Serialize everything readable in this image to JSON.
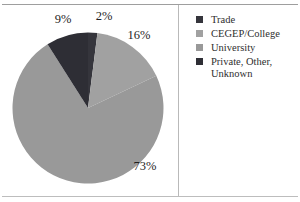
{
  "chart_data": {
    "type": "pie",
    "title": "",
    "values_unit": "%",
    "direction": "clockwise",
    "start_angle_deg": 0,
    "legend_position": "right",
    "slices": [
      {
        "id": "trade",
        "label": "Trade",
        "value": 2,
        "pct_label": "2%",
        "color": "#35353c"
      },
      {
        "id": "cegep-college",
        "label": "CEGEP/College",
        "value": 16,
        "pct_label": "16%",
        "color": "#a1a1a1"
      },
      {
        "id": "university",
        "label": "University",
        "value": 73,
        "pct_label": "73%",
        "color": "#999999"
      },
      {
        "id": "private-other-unknown",
        "label": "Private, Other, Unknown",
        "value": 9,
        "pct_label": "9%",
        "color": "#2e2e35"
      }
    ]
  }
}
